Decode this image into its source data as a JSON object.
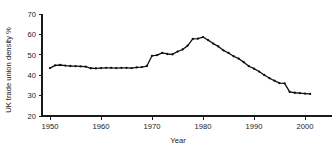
{
  "chart_data": {
    "type": "line",
    "title": "",
    "subtitle": "",
    "xlabel": "Year",
    "ylabel": "UK trade union density %",
    "xlim": [
      1948,
      2003
    ],
    "ylim": [
      20,
      70
    ],
    "xticks": [
      1950,
      1960,
      1970,
      1980,
      1990,
      2000
    ],
    "xtick_labels": [
      "1950",
      "1960",
      "1970",
      "1980",
      "1990",
      "2000"
    ],
    "yticks": [
      20,
      30,
      40,
      50,
      60,
      70
    ],
    "ytick_labels": [
      "20",
      "30",
      "40",
      "50",
      "60",
      "70"
    ],
    "grid": false,
    "legend": false,
    "legend_position": "none",
    "marker": "filled-circle",
    "line_color": "#111111",
    "marker_color": "#111111",
    "x": [
      1950,
      1951,
      1952,
      1953,
      1954,
      1955,
      1956,
      1957,
      1958,
      1959,
      1960,
      1961,
      1962,
      1963,
      1964,
      1965,
      1966,
      1967,
      1968,
      1969,
      1970,
      1971,
      1972,
      1973,
      1974,
      1975,
      1976,
      1977,
      1978,
      1979,
      1980,
      1981,
      1982,
      1983,
      1984,
      1985,
      1986,
      1987,
      1988,
      1989,
      1990,
      1991,
      1992,
      1993,
      1994,
      1995,
      1996,
      1997,
      1998,
      1999,
      2000,
      2001
    ],
    "values": [
      43.5,
      44.8,
      45.0,
      44.7,
      44.5,
      44.4,
      44.3,
      44.2,
      43.4,
      43.3,
      43.5,
      43.6,
      43.6,
      43.5,
      43.6,
      43.6,
      43.5,
      43.8,
      44.0,
      44.5,
      49.5,
      49.8,
      50.9,
      50.4,
      50.2,
      51.6,
      52.6,
      54.5,
      57.8,
      57.9,
      58.7,
      57.2,
      55.5,
      54.1,
      52.2,
      50.9,
      49.3,
      48.1,
      46.4,
      44.4,
      43.2,
      41.8,
      40.1,
      38.6,
      37.3,
      36.1,
      36.0,
      31.8,
      31.4,
      31.2,
      31.0,
      30.8
    ]
  },
  "axis": {
    "y_title": "UK trade union density %",
    "x_title": "Year"
  }
}
